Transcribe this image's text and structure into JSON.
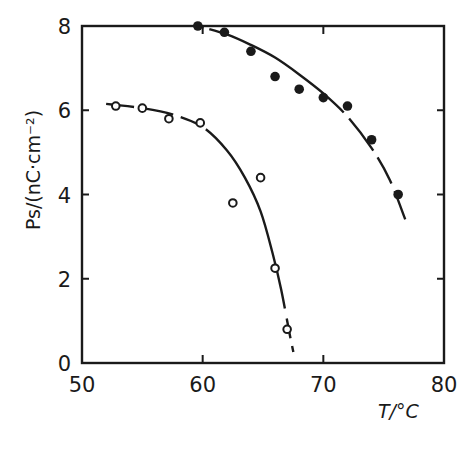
{
  "chart_data": {
    "type": "scatter",
    "title": "",
    "xlabel": "T/°C",
    "ylabel": "Ps/(nC·cm⁻²)",
    "xlim": [
      50,
      80
    ],
    "ylim": [
      0,
      8
    ],
    "x_ticks": [
      50,
      60,
      70,
      80
    ],
    "y_ticks": [
      0,
      2,
      4,
      6,
      8
    ],
    "x_tick_labels": [
      "50",
      "60",
      "70",
      "80"
    ],
    "y_tick_labels": [
      "0",
      "2",
      "4",
      "6",
      "8"
    ],
    "grid": false,
    "legend": null,
    "series": [
      {
        "name": "filled circles",
        "marker": "filled-circle",
        "x": [
          59.6,
          61.8,
          64.0,
          66.0,
          68.0,
          70.0,
          72.0,
          74.0,
          76.2
        ],
        "y": [
          8.0,
          7.85,
          7.4,
          6.8,
          6.5,
          6.3,
          6.1,
          5.3,
          4.0
        ],
        "fit_curve": {
          "style": "solid-with-dashed-ends",
          "x": [
            59.6,
            62,
            64,
            66,
            68,
            70,
            72,
            74,
            75.5,
            76.8
          ],
          "y": [
            8.0,
            7.8,
            7.55,
            7.25,
            6.85,
            6.4,
            5.85,
            5.1,
            4.35,
            3.4
          ]
        }
      },
      {
        "name": "open circles",
        "marker": "open-circle",
        "x": [
          52.8,
          55.0,
          57.2,
          59.8,
          62.5,
          64.8,
          66.0,
          67.0
        ],
        "y": [
          6.1,
          6.05,
          5.8,
          5.7,
          3.8,
          4.4,
          2.25,
          0.8
        ],
        "fit_curve": {
          "style": "solid-with-dashed-ends",
          "x": [
            52.0,
            55,
            57.5,
            60,
            62,
            63.5,
            64.8,
            65.8,
            66.5,
            67.2,
            67.6
          ],
          "y": [
            6.15,
            6.05,
            5.9,
            5.6,
            5.05,
            4.4,
            3.6,
            2.6,
            1.75,
            0.7,
            0.15
          ]
        }
      }
    ]
  }
}
